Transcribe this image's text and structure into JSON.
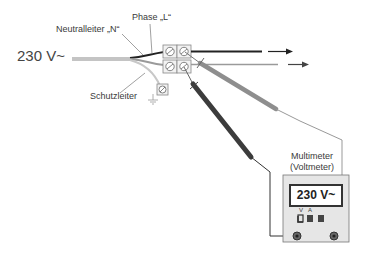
{
  "labels": {
    "voltage": "230 V~",
    "neutral": "Neutralleiter „N“",
    "phase": "Phase „L“",
    "protective_earth": "Schutzleiter",
    "meter_title_line1": "Multimeter",
    "meter_title_line2": "(Voltmeter)",
    "display": "230 V~",
    "socket_v": "V",
    "socket_a": "A"
  },
  "colors": {
    "phase_wire": "#222222",
    "neutral_wire": "#9a9a9a",
    "earth_wire": "#c8c8c8",
    "probe_dark": "#3c3c3c",
    "probe_light": "#8e8e8e",
    "meter_body": "#e6e6e6"
  }
}
